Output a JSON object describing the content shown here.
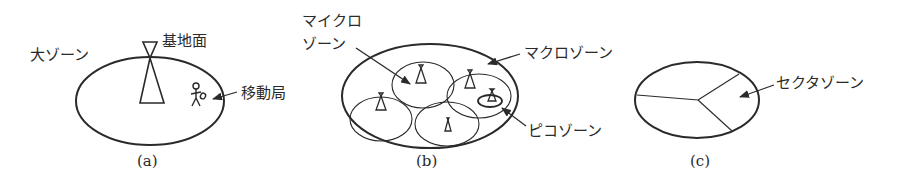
{
  "figure": {
    "panels": [
      {
        "id": "a",
        "caption": "(a)",
        "labels": {
          "zone": "大ゾーン",
          "base_station": "基地面",
          "mobile_station": "移動局"
        }
      },
      {
        "id": "b",
        "caption": "(b)",
        "labels": {
          "micro_line1": "マイクロ",
          "micro_line2": "ゾーン",
          "macro": "マクロゾーン",
          "pico": "ピコゾーン"
        }
      },
      {
        "id": "c",
        "caption": "(c)",
        "labels": {
          "sector": "セクタゾーン"
        }
      }
    ]
  },
  "colors": {
    "line": "#2a2a2a",
    "background": "#ffffff"
  }
}
